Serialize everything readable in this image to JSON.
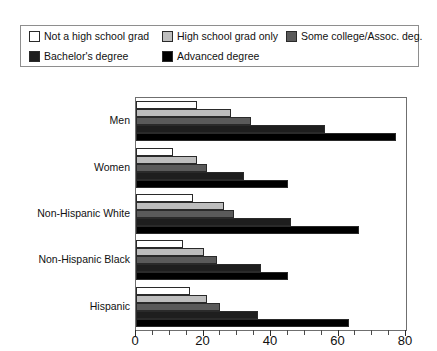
{
  "legend": {
    "items": [
      {
        "label": "Not a high school grad",
        "color": "#ffffff",
        "key": "not_hs_grad"
      },
      {
        "label": "High school grad only",
        "color": "#bdbdbd",
        "key": "hs_grad_only"
      },
      {
        "label": "Some college/Assoc. deg.",
        "color": "#5a5a5a",
        "key": "some_college"
      },
      {
        "label": "Bachelor's degree",
        "color": "#1e1e1e",
        "key": "bachelors"
      },
      {
        "label": "Advanced degree",
        "color": "#000000",
        "key": "advanced"
      }
    ]
  },
  "chart_data": {
    "type": "bar",
    "orientation": "horizontal",
    "title": "",
    "subtitle": "",
    "xlabel": "",
    "ylabel": "",
    "xlim": [
      0,
      80
    ],
    "xticks": [
      0,
      20,
      40,
      60,
      80
    ],
    "xtick_labels": [
      "0",
      "20",
      "40",
      "60",
      "80"
    ],
    "minor_tick_step": 5,
    "grid": false,
    "legend_position": "top",
    "categories": [
      "Men",
      "Women",
      "Non-Hispanic White",
      "Non-Hispanic Black",
      "Hispanic"
    ],
    "series": [
      {
        "name": "Not a high school grad",
        "color": "#ffffff",
        "values": [
          18,
          11,
          17,
          14,
          16
        ]
      },
      {
        "name": "High school grad only",
        "color": "#bdbdbd",
        "values": [
          28,
          18,
          26,
          20,
          21
        ]
      },
      {
        "name": "Some college/Assoc. deg.",
        "color": "#5a5a5a",
        "values": [
          34,
          21,
          29,
          24,
          25
        ]
      },
      {
        "name": "Bachelor's degree",
        "color": "#1e1e1e",
        "values": [
          56,
          32,
          46,
          37,
          36
        ]
      },
      {
        "name": "Advanced degree",
        "color": "#000000",
        "values": [
          77,
          45,
          66,
          45,
          63
        ]
      }
    ]
  }
}
